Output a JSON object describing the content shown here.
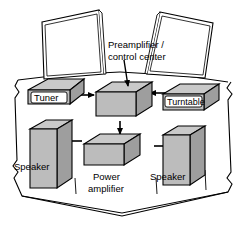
{
  "diagram": {
    "background_color": "#ffffff",
    "line_color": "#000000",
    "box_colors": {
      "top_face": "#c9c9c9",
      "front_face": "#bcbcbc",
      "side_face": "#9e9e9e",
      "label_plate": "#ffffff"
    },
    "components": [
      {
        "id": "tuner",
        "label": "Tuner",
        "label_style": "plate"
      },
      {
        "id": "preamplifier",
        "label": "Preamplifier / control center",
        "label_line_1": "Preamplifier /",
        "label_line_2": "control center",
        "label_style": "callout"
      },
      {
        "id": "turntable",
        "label": "Turntable",
        "label_style": "plate"
      },
      {
        "id": "speaker_left",
        "label": "Speaker",
        "label_style": "overlay"
      },
      {
        "id": "power_amplifier",
        "label": "Power amplifier",
        "label_line_1": "Power",
        "label_line_2": "amplifier",
        "label_style": "below"
      },
      {
        "id": "speaker_right",
        "label": "Speaker",
        "label_style": "overlay"
      }
    ],
    "connections": [
      {
        "from": "tuner",
        "to": "preamplifier",
        "direction": "right"
      },
      {
        "from": "turntable",
        "to": "preamplifier",
        "direction": "left"
      },
      {
        "from": "preamplifier",
        "to": "power_amplifier",
        "direction": "down"
      },
      {
        "from": "power_amplifier",
        "to": "speaker_left",
        "direction": "left"
      },
      {
        "from": "power_amplifier",
        "to": "speaker_right",
        "direction": "right"
      }
    ],
    "room": {
      "shape": "octagonal-room-outline",
      "panels": [
        {
          "id": "wall_panel_left",
          "fill": "#ffffff"
        },
        {
          "id": "wall_panel_right",
          "fill": "#ffffff"
        }
      ]
    }
  }
}
